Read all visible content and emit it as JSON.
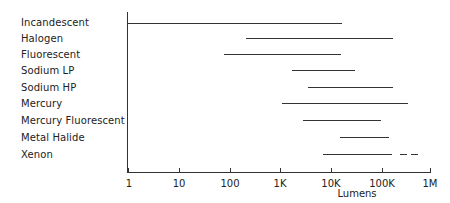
{
  "chart_data": {
    "type": "range",
    "title": "",
    "xlabel": "Lumens",
    "ylabel": "",
    "xscale": "log",
    "xlim": [
      1,
      1000000
    ],
    "xticks": [
      "1",
      "10",
      "100",
      "1K",
      "10K",
      "100K",
      "1M"
    ],
    "grid": false,
    "categories": [
      "Incandescent",
      "Halogen",
      "Fluorescent",
      "Sodium LP",
      "Sodium HP",
      "Mercury",
      "Mercury Fluorescent",
      "Metal Halide",
      "Xenon"
    ],
    "series": [
      {
        "name": "Incandescent",
        "min": 1,
        "max": 17000
      },
      {
        "name": "Halogen",
        "min": 210,
        "max": 170000
      },
      {
        "name": "Fluorescent",
        "min": 80,
        "max": 16000
      },
      {
        "name": "Sodium LP",
        "min": 1700,
        "max": 30000
      },
      {
        "name": "Sodium HP",
        "min": 3500,
        "max": 170000
      },
      {
        "name": "Mercury",
        "min": 1100,
        "max": 330000
      },
      {
        "name": "Mercury Fluorescent",
        "min": 2800,
        "max": 100000
      },
      {
        "name": "Metal Halide",
        "min": 15000,
        "max": 140000
      },
      {
        "name": "Xenon",
        "min": 7000,
        "max": 160000,
        "extended_max": 520000,
        "extended_style": "dashed"
      }
    ]
  },
  "labels": [
    "Incandescent",
    "Halogen",
    "Fluorescent",
    "Sodium LP",
    "Sodium HP",
    "Mercury",
    "Mercury Fluorescent",
    "Metal Halide",
    "Xenon"
  ],
  "ticks": [
    "1",
    "10",
    "100",
    "1K",
    "10K",
    "100K",
    "1M"
  ],
  "xlabel": "Lumens"
}
